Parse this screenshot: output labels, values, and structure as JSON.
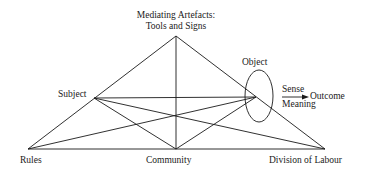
{
  "diagram": {
    "nodes": {
      "mediating_artefacts": {
        "line1": "Mediating Artefacts:",
        "line2": "Tools and Signs"
      },
      "subject": "Subject",
      "object": "Object",
      "rules": "Rules",
      "community": "Community",
      "division_of_labour": "Division of Labour"
    },
    "transformation": {
      "sense": "Sense",
      "meaning": "Meaning",
      "outcome": "Outcome"
    },
    "colors": {
      "line": "#1a1a1a",
      "background": "#ffffff"
    }
  }
}
